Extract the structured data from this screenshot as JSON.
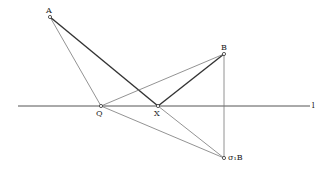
{
  "diagram": {
    "line_label": "l",
    "points": {
      "A": {
        "label": "A",
        "x": 50,
        "y": 17
      },
      "B": {
        "label": "B",
        "x": 224,
        "y": 54
      },
      "Q": {
        "label": "Q",
        "x": 101,
        "y": 106
      },
      "X": {
        "label": "X",
        "x": 158,
        "y": 106
      },
      "sB": {
        "label": "σ₁B",
        "x": 224,
        "y": 158
      }
    },
    "colors": {
      "line": "#555555",
      "thick": "#333333"
    }
  }
}
